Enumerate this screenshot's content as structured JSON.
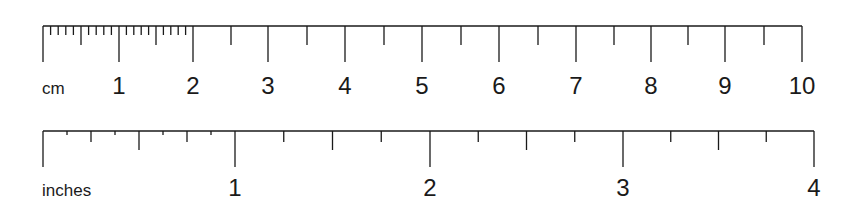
{
  "cm_ruler": {
    "unit_label": "cm",
    "numbers": [
      "1",
      "2",
      "3",
      "4",
      "5",
      "6",
      "7",
      "8",
      "9",
      "10"
    ],
    "major_positions": [
      43,
      119,
      193,
      268,
      345,
      422,
      499,
      576,
      651,
      725,
      802
    ],
    "half_positions": [
      81,
      156,
      231,
      307,
      384,
      461,
      538,
      614,
      688,
      764
    ],
    "mm_subdivided_range": [
      0,
      2
    ],
    "baseline_y": 26,
    "major_tick_bottom": 62,
    "half_tick_bottom": 45,
    "mm_tick_bottom": 35,
    "label_y": 94
  },
  "inch_ruler": {
    "unit_label": "inches",
    "numbers": [
      "1",
      "2",
      "3",
      "4"
    ],
    "major_positions": [
      43,
      235,
      430,
      623,
      814
    ],
    "baseline_y": 131,
    "major_tick_bottom": 167,
    "half_tick_bottom": 150,
    "quarter_tick_bottom": 142,
    "eighth_tick_bottom": 135,
    "eighth_subdivided_range": [
      0,
      1
    ],
    "label_y": 196
  },
  "colors": {
    "ink": "#1a1a1a",
    "background": "#ffffff"
  }
}
